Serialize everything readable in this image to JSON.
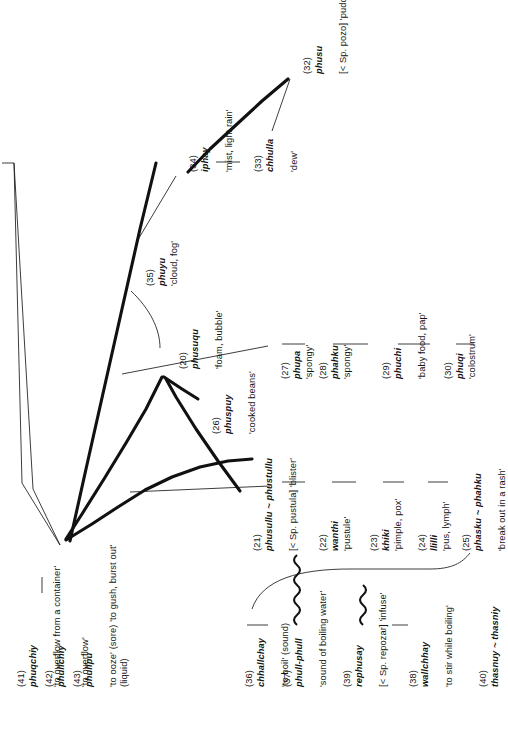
{
  "figure": {
    "kind": "lexical-semantic network diagram",
    "orientation": "rotated-90-ccw"
  },
  "nodes": [
    {
      "id": "n41",
      "num": "(41)",
      "headword": "phuqchiy",
      "gloss": "'to overflow from a container'"
    },
    {
      "id": "n42",
      "num": "(42)",
      "headword": "phullchiy",
      "gloss": "'to overflow'"
    },
    {
      "id": "n43",
      "num": "(43)",
      "headword": "phullpu",
      "gloss": "'to ooze' (sore) 'to gush, burst out' (liquid)"
    },
    {
      "id": "n36",
      "num": "(36)",
      "headword": "chhallchay",
      "gloss": "'to boil' (sound)"
    },
    {
      "id": "n37",
      "num": "(37)",
      "headword": "phull-phull",
      "gloss": "'sound of boiling water'"
    },
    {
      "id": "n39",
      "num": "(39)",
      "headword": "rephusay",
      "gloss": "[< Sp. repozar] 'infuse'"
    },
    {
      "id": "n38",
      "num": "(38)",
      "headword": "wallchhay",
      "gloss": "'to stir while boiling'"
    },
    {
      "id": "n40",
      "num": "(40)",
      "headword": "thasnuy ~ thasniy",
      "gloss": ""
    },
    {
      "id": "n21",
      "num": "(21)",
      "headword": "phusullu ~ phustullu",
      "gloss": "[< Sp. pustula] 'blister'"
    },
    {
      "id": "n22",
      "num": "(22)",
      "headword": "wanthi",
      "gloss": "'pustule'"
    },
    {
      "id": "n23",
      "num": "(23)",
      "headword": "khiki",
      "gloss": "'pimple, pox'"
    },
    {
      "id": "n24",
      "num": "(24)",
      "headword": "llilli",
      "gloss": "'pus, lymph'"
    },
    {
      "id": "n25",
      "num": "(25)",
      "headword": "phasku ~ phahku",
      "gloss": "'break out in a rash'"
    },
    {
      "id": "n20",
      "num": "(20)",
      "headword": "phusuqu",
      "gloss": "'foam, bubble'"
    },
    {
      "id": "n26",
      "num": "(26)",
      "headword": "phuspuy",
      "gloss": "'cooked beans'"
    },
    {
      "id": "n27",
      "num": "(27)",
      "headword": "phupa",
      "gloss": "'spongy'"
    },
    {
      "id": "n28",
      "num": "(28)",
      "headword": "phahku",
      "gloss": "'spongy'"
    },
    {
      "id": "n29",
      "num": "(29)",
      "headword": "phuchi",
      "gloss": "'baby food, pap'"
    },
    {
      "id": "n30",
      "num": "(30)",
      "headword": "phuqi",
      "gloss": "'colostrum'"
    },
    {
      "id": "n35",
      "num": "(35)",
      "headword": "phuyu",
      "gloss": "'cloud, fog'"
    },
    {
      "id": "n34",
      "num": "(34)",
      "headword": "iphay",
      "gloss": "'mist, light rain'"
    },
    {
      "id": "n33",
      "num": "(33)",
      "headword": "chhulla",
      "gloss": "'dew'"
    },
    {
      "id": "n32",
      "num": "(32)",
      "headword": "phusu",
      "gloss": "[< Sp. pozo] 'puddle'"
    }
  ],
  "colors": {
    "ink": "#141414",
    "paper": "#ffffff"
  }
}
